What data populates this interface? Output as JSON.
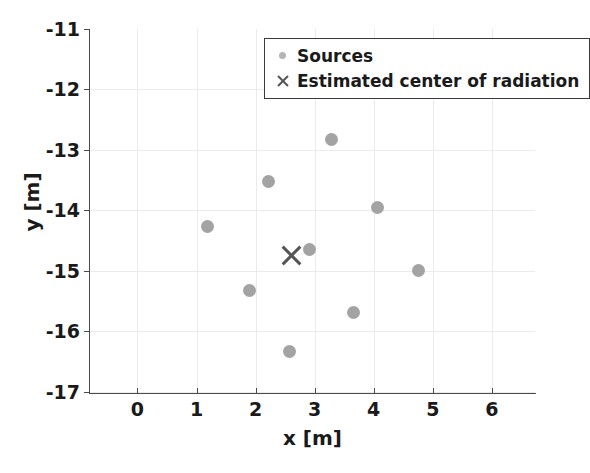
{
  "chart_data": {
    "type": "scatter",
    "title": "",
    "xlabel": "x [m]",
    "ylabel": "y [m]",
    "xlim": [
      -0.82,
      6.73
    ],
    "ylim": [
      -17.02,
      -11.0
    ],
    "xticks": [
      0,
      1,
      2,
      3,
      4,
      5,
      6
    ],
    "xticklabels": [
      "0",
      "1",
      "2",
      "3",
      "4",
      "5",
      "6"
    ],
    "yticks": [
      -11,
      -12,
      -13,
      -14,
      -15,
      -16,
      -17
    ],
    "yticklabels": [
      "-11",
      "-12",
      "-13",
      "-14",
      "-15",
      "-16",
      "-17"
    ],
    "grid": true,
    "legend_position": "upper right",
    "series": [
      {
        "name": "Sources",
        "marker": "circle",
        "color": "#a3a3a3",
        "points": [
          {
            "x": 1.19,
            "y": -14.27
          },
          {
            "x": 1.9,
            "y": -15.33
          },
          {
            "x": 2.22,
            "y": -13.53
          },
          {
            "x": 2.58,
            "y": -16.34
          },
          {
            "x": 2.92,
            "y": -14.64
          },
          {
            "x": 3.29,
            "y": -12.82
          },
          {
            "x": 3.66,
            "y": -15.69
          },
          {
            "x": 4.07,
            "y": -13.96
          },
          {
            "x": 4.75,
            "y": -14.99
          }
        ]
      },
      {
        "name": "Estimated center of radiation",
        "marker": "x",
        "color": "#555555",
        "points": [
          {
            "x": 2.61,
            "y": -14.74
          }
        ]
      }
    ]
  },
  "legend": {
    "entries": [
      {
        "label": "Sources",
        "symbol": "circle-marker"
      },
      {
        "label": "Estimated center of radiation",
        "symbol": "x-marker"
      }
    ]
  },
  "axis": {
    "x_title": "x [m]",
    "y_title": "y [m]"
  }
}
